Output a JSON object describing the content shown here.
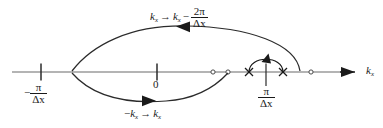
{
  "figure": {
    "type": "axis-diagram",
    "background": "#ffffff",
    "line_color": "#2b2b2b",
    "axis": {
      "name": "kx-axis",
      "label": "k",
      "label_sub": "x",
      "label_x": 366,
      "label_y": 66,
      "y": 72,
      "x_start": 12,
      "x_end": 357,
      "arrow": "right"
    },
    "ticks": [
      {
        "name": "tick-minus-pi-over-dx",
        "x": 41,
        "label_num": "π",
        "label_den": "Δx",
        "sign": "−",
        "label_text": "-π/Δx"
      },
      {
        "name": "tick-zero",
        "x": 157,
        "label_text": "0"
      },
      {
        "name": "tick-pi-over-dx",
        "x": 266,
        "label_num": "π",
        "label_den": "Δx",
        "sign": "",
        "label_text": "π/Δx"
      }
    ],
    "x_marks": [
      {
        "name": "x-mark-left",
        "x": 249,
        "y": 72
      },
      {
        "name": "x-mark-right",
        "x": 283,
        "y": 72
      }
    ],
    "open_circles": [
      {
        "name": "open-circle-a",
        "x": 213,
        "y": 72
      },
      {
        "name": "open-circle-b",
        "x": 228,
        "y": 72
      },
      {
        "name": "open-circle-c",
        "x": 311,
        "y": 72
      }
    ],
    "curves": [
      {
        "name": "upper-wrap-arrow",
        "direction": "leftward",
        "from_x": 300,
        "to_x": 72,
        "peak_y": 31,
        "arrow_x": 180,
        "arrow_y": 32
      },
      {
        "name": "lower-reflect-arrow",
        "direction": "rightward",
        "from_x": 72,
        "to_x": 228,
        "trough_y": 102,
        "arrow_x": 148,
        "arrow_y": 100
      },
      {
        "name": "small-wrap-arc",
        "direction": "up",
        "from_x": 249,
        "to_x": 283,
        "top_y": 57,
        "arrow_x": 267,
        "arrow_y": 56
      }
    ],
    "labels": {
      "top": {
        "name": "top-transform-label",
        "x": 150,
        "y": 7,
        "lhs": "k",
        "lhs_sub": "x",
        "arrow": "→",
        "rhs": "k",
        "rhs_sub": "x",
        "minus": "−",
        "frac_num": "2π",
        "frac_den": "Δx",
        "text": "k_x → k_x − 2π/Δx"
      },
      "bottom": {
        "name": "bottom-transform-label",
        "x": 124,
        "y": 108,
        "lhs_sign": "−",
        "lhs": "k",
        "lhs_sub": "x",
        "arrow": "→",
        "rhs": "k",
        "rhs_sub": "x",
        "text": "-k_x → k_x"
      }
    }
  }
}
